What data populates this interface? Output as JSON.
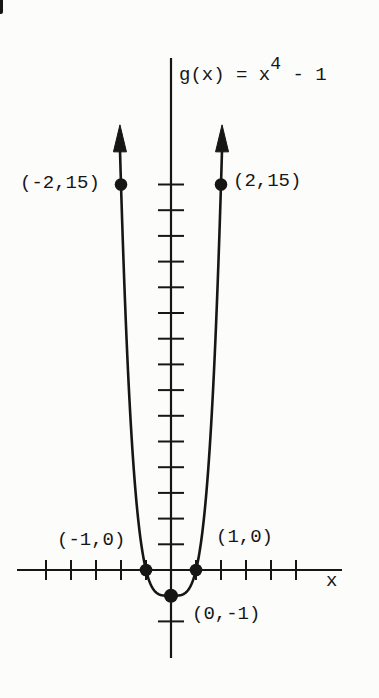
{
  "figure": {
    "background": "#fcfcfb",
    "ink": "#161616"
  },
  "chart_data": {
    "type": "line",
    "function": {
      "power": 4,
      "offset": -1,
      "expression": "x^4 - 1"
    },
    "equation": {
      "prefix": "g(x) = x",
      "exponent": "4",
      "suffix": " - 1"
    },
    "x_axis_label": "x",
    "xlabel": "x",
    "ylabel": "",
    "grid": false,
    "legend": false,
    "x_ticks": [
      -5,
      -4,
      -3,
      -2,
      -1,
      1,
      2,
      3,
      4,
      5
    ],
    "y_ticks": [
      1,
      2,
      3,
      4,
      5,
      6,
      7,
      8,
      9,
      10,
      11,
      12,
      13,
      14,
      15
    ],
    "y_ticks_negative": [
      -2
    ],
    "xlim": [
      -6.2,
      6.8
    ],
    "ylim": [
      -3.4,
      19.9
    ],
    "curve_x_range": [
      -2.042,
      2.042
    ],
    "curve_arrows": "both branches end in upward arrows",
    "points": [
      {
        "x": -2,
        "y": 15,
        "label": "(-2,15)",
        "label_side": "left"
      },
      {
        "x": 2,
        "y": 15,
        "label": "(2,15)",
        "label_side": "right"
      },
      {
        "x": -1,
        "y": 0,
        "label": "(-1,0)",
        "label_side": "left"
      },
      {
        "x": 1,
        "y": 0,
        "label": "(1,0)",
        "label_side": "right"
      },
      {
        "x": 0,
        "y": -1,
        "label": "(0,-1)",
        "label_side": "right"
      }
    ]
  }
}
